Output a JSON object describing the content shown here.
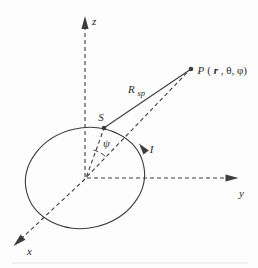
{
  "diagram": {
    "title_hint": "current-loop coordinate geometry figure",
    "background_color": "#fdfdfd",
    "line_color": "#3d3d3d",
    "text_color": "#2a2a2a",
    "artifact_color": "#ebebeb",
    "axes": {
      "z_label": "z",
      "y_label": "y",
      "x_label": "x"
    },
    "points": {
      "source_label": "S",
      "field_point_p": "P",
      "field_point_open_paren": "(",
      "field_point_r": "r",
      "field_point_rest": ", θ, φ)"
    },
    "distance_vector": {
      "symbol": "R",
      "subscript": "sp"
    },
    "angle_label": "ψ",
    "current_label": "I"
  }
}
